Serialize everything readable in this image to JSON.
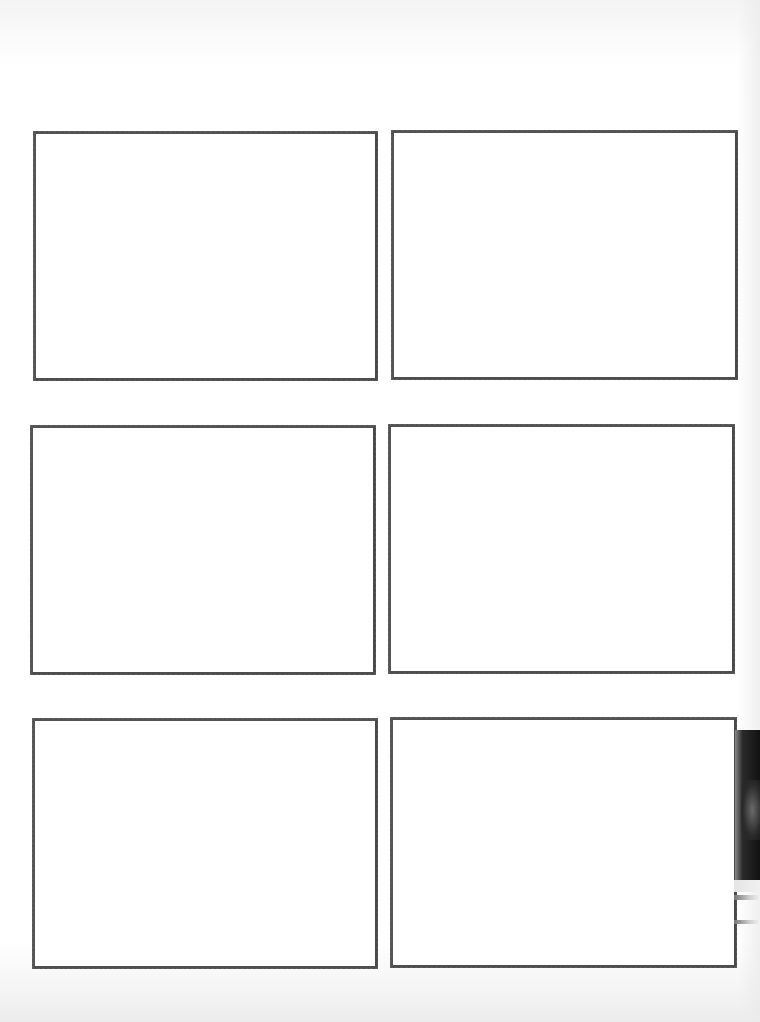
{
  "document": {
    "type": "storyboard-template",
    "layout": {
      "rows": 3,
      "columns": 2
    },
    "border_color": "#4a4a4a",
    "background_color": "#ffffff",
    "panels": [
      {
        "id": 1,
        "row": 1,
        "col": 1,
        "content": ""
      },
      {
        "id": 2,
        "row": 1,
        "col": 2,
        "content": ""
      },
      {
        "id": 3,
        "row": 2,
        "col": 1,
        "content": ""
      },
      {
        "id": 4,
        "row": 2,
        "col": 2,
        "content": ""
      },
      {
        "id": 5,
        "row": 3,
        "col": 1,
        "content": ""
      },
      {
        "id": 6,
        "row": 3,
        "col": 2,
        "content": ""
      }
    ]
  }
}
